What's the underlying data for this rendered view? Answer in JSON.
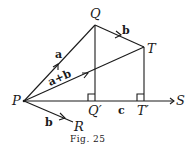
{
  "figure": {
    "caption": "Fig. 25",
    "points": {
      "P": {
        "label": "P",
        "x": 24,
        "y": 101
      },
      "Q": {
        "label": "Q",
        "x": 95,
        "y": 25
      },
      "T": {
        "label": "T",
        "x": 144,
        "y": 47
      },
      "Q_prime": {
        "label": "Q′",
        "x": 95,
        "y": 101
      },
      "T_prime": {
        "label": "T′",
        "x": 144,
        "y": 101
      },
      "S": {
        "label": "S",
        "x": 176,
        "y": 101
      },
      "R": {
        "label": "R",
        "x": 74,
        "y": 124
      }
    },
    "vectors": {
      "a": "a",
      "b_QT": "b",
      "a_plus_b": "a+b",
      "b_PR": "b",
      "c": "c"
    },
    "colors": {
      "ink": "#1a1a1a",
      "background": "#ffffff"
    }
  }
}
